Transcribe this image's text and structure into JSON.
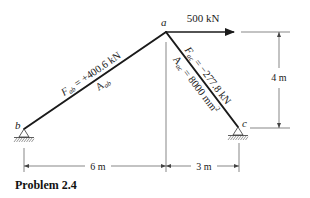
{
  "nodes": {
    "a": {
      "label": "a"
    },
    "b": {
      "label": "b"
    },
    "c": {
      "label": "c"
    }
  },
  "members": {
    "ab": {
      "force_label": "F",
      "force_sub": "ab",
      "force_value": " = +400.6 kN",
      "area_label": "A",
      "area_sub": "ab"
    },
    "ac": {
      "force_label": "F",
      "force_sub": "ac",
      "force_value": " = −277.8 kN",
      "area_label": "A",
      "area_sub": "ac",
      "area_value": " = 8000 mm",
      "area_exp": "2"
    }
  },
  "load": {
    "label": "500 kN"
  },
  "dimensions": {
    "horizontal_left": "6 m",
    "horizontal_right": "3 m",
    "vertical": "4 m"
  },
  "caption": "Problem 2.4",
  "colors": {
    "ink": "#1a1a1a",
    "dim": "#555555",
    "background": "#ffffff"
  }
}
